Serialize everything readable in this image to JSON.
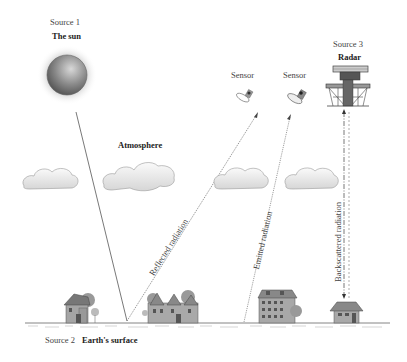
{
  "labels": {
    "source1": "Source 1",
    "sun": "The sun",
    "source2": "Source 2",
    "earth": "Earth's surface",
    "source3": "Source 3",
    "radar": "Radar",
    "sensor1": "Sensor",
    "sensor2": "Sensor",
    "atmosphere": "Atmosphere",
    "reflected": "Reflected radiation",
    "emitted": "Emitted radiation",
    "backscattered": "Backscattered radiation"
  },
  "colors": {
    "line": "#555555",
    "cloud_fill": "#f2f2f2",
    "cloud_stroke": "#9a9a9a",
    "sun_core": "#777777",
    "building": "#8a8a8a"
  },
  "elements": {
    "sources": [
      "The sun",
      "Earth's surface",
      "Radar"
    ],
    "sensors": 2,
    "clouds": 4,
    "radiation_paths": [
      "Incident (sun to ground)",
      "Reflected radiation",
      "Emitted radiation",
      "Backscattered radiation"
    ]
  }
}
